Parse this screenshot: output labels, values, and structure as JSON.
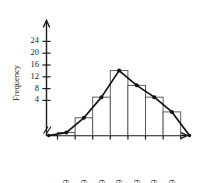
{
  "chart_data": {
    "type": "bar",
    "title": "",
    "subtitle": "",
    "xlabel": "",
    "ylabel": "Frequency",
    "categories": [
      "30-39",
      "40-49",
      "50-59",
      "60-69",
      "70-79",
      "80-89",
      "90-99"
    ],
    "values": [
      1,
      6,
      13,
      22,
      17,
      13,
      8
    ],
    "series": [
      {
        "name": "Histogram",
        "values": [
          1,
          6,
          13,
          22,
          17,
          13,
          8
        ]
      },
      {
        "name": "Frequency polygon",
        "x": [
          "20-29",
          "30-39",
          "40-49",
          "50-59",
          "60-69",
          "70-79",
          "80-89",
          "90-99",
          "100-109"
        ],
        "values": [
          0,
          1,
          6,
          13,
          22,
          17,
          13,
          8,
          0
        ]
      }
    ],
    "ylim": [
      0,
      26
    ],
    "yticks": [
      4,
      8,
      12,
      16,
      20,
      24
    ],
    "ytick_labels": [
      "4",
      "8",
      "12",
      "16",
      "20",
      "24"
    ],
    "grid": false,
    "legend": false,
    "axis_break": "//"
  },
  "axis": {
    "y_title": "Frequency",
    "break_symbol": "//"
  },
  "icons": {
    "axis_break": "axis-break-icon",
    "data_point": "data-point-marker"
  }
}
